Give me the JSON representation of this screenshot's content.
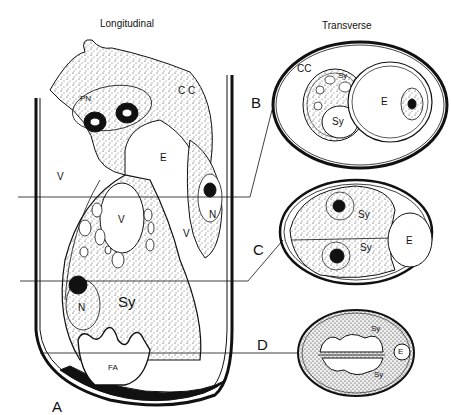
{
  "figure": {
    "titles": {
      "longitudinal": "Longitudinal",
      "transverse": "Transverse"
    },
    "section_markers": [
      "A",
      "B",
      "C",
      "D"
    ],
    "longitudinal_labels": {
      "pn": "PN",
      "cc": "C C",
      "e": "E",
      "v_left": "V",
      "v_center": "V",
      "v_right": "V",
      "n_right": "N",
      "n_left": "N",
      "sy": "Sy",
      "fa": "FA"
    },
    "transverse_b": {
      "cc": "CC",
      "sy_top": "Sy",
      "sy_bottom": "Sy",
      "e": "E"
    },
    "transverse_c": {
      "sy_top": "Sy",
      "sy_bottom": "Sy",
      "e": "E"
    },
    "transverse_d": {
      "sy_top": "Sy",
      "sy_bottom": "Sy",
      "e": "E"
    },
    "colors": {
      "ink": "#111111",
      "background": "#ffffff",
      "stipple": "#d9d9d9"
    }
  }
}
